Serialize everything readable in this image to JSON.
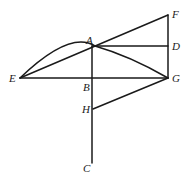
{
  "figure": {
    "type": "geometric-construction",
    "points": [
      {
        "id": "A",
        "label": "A"
      },
      {
        "id": "B",
        "label": "B"
      },
      {
        "id": "C",
        "label": "C"
      },
      {
        "id": "D",
        "label": "D"
      },
      {
        "id": "E",
        "label": "E"
      },
      {
        "id": "F",
        "label": "F"
      },
      {
        "id": "G",
        "label": "G"
      },
      {
        "id": "H",
        "label": "H"
      }
    ],
    "segments": [
      [
        "E",
        "F"
      ],
      [
        "A",
        "D"
      ],
      [
        "F",
        "G"
      ],
      [
        "E",
        "G"
      ],
      [
        "A",
        "C"
      ],
      [
        "H",
        "G"
      ]
    ],
    "arcs": [
      {
        "through": [
          "E",
          "A",
          "G"
        ]
      }
    ]
  }
}
